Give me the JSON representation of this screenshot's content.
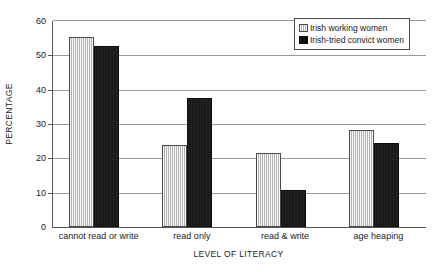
{
  "chart_data": {
    "type": "bar",
    "title": "",
    "xlabel": "LEVEL OF LITERACY",
    "ylabel": "PERCENTAGE",
    "categories": [
      "cannot read or write",
      "read only",
      "read & write",
      "age heaping"
    ],
    "series": [
      {
        "name": "Irish working women",
        "values": [
          55.3,
          24.0,
          21.6,
          28.4
        ],
        "color": "#d2d2d2"
      },
      {
        "name": "Irish-tried convict women",
        "values": [
          52.6,
          37.6,
          10.7,
          24.6
        ],
        "color": "#141414"
      }
    ],
    "ylim": [
      0,
      60
    ],
    "yticks": [
      0,
      10,
      20,
      30,
      40,
      50,
      60
    ],
    "ytick_labels": [
      "0",
      "10",
      "20",
      "30",
      "40",
      "50",
      "60"
    ],
    "grid": true,
    "grid_axis": "y",
    "legend_position": "top-right",
    "legend": [
      "Irish working women",
      "Irish-tried convict women"
    ]
  },
  "axes": {
    "y_title": "PERCENTAGE",
    "x_title": "LEVEL OF LITERACY"
  },
  "legend": {
    "entries": [
      {
        "label": "Irish working women",
        "swatch": "light-hatched-swatch"
      },
      {
        "label": "Irish-tried convict women",
        "swatch": "dark-solid-swatch"
      }
    ]
  }
}
